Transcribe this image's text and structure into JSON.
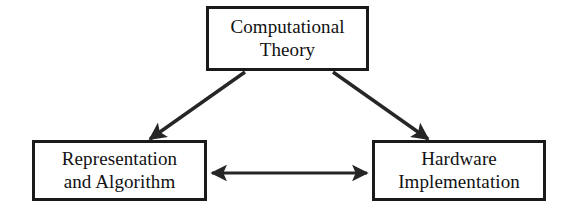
{
  "diagram": {
    "background_color": "#ffffff",
    "box_border_color": "#1a1a1a",
    "arrow_color": "#262626",
    "text_color": "#111111",
    "nodes": [
      {
        "id": "computational-theory",
        "label": "Computational\nTheory",
        "line1": "Computational",
        "line2": "Theory",
        "x": 206,
        "y": 6,
        "width": 163,
        "height": 65
      },
      {
        "id": "representation-and-algorithm",
        "label": "Representation\nand Algorithm",
        "line1": "Representation",
        "line2": "and Algorithm",
        "x": 32,
        "y": 140,
        "width": 175,
        "height": 61
      },
      {
        "id": "hardware-implementation",
        "label": "Hardware\nImplementation",
        "line1": "Hardware",
        "line2": "Implementation",
        "x": 372,
        "y": 140,
        "width": 174,
        "height": 61
      }
    ],
    "edges": [
      {
        "id": "theory-to-representation",
        "from": "computational-theory",
        "to": "representation-and-algorithm",
        "style": "single-arrow",
        "x1": 245,
        "y1": 72,
        "x2": 150,
        "y2": 139
      },
      {
        "id": "theory-to-hardware",
        "from": "computational-theory",
        "to": "hardware-implementation",
        "style": "single-arrow",
        "x1": 333,
        "y1": 72,
        "x2": 428,
        "y2": 139
      },
      {
        "id": "representation-to-hardware",
        "from": "representation-and-algorithm",
        "to": "hardware-implementation",
        "style": "double-arrow",
        "x1": 208,
        "y1": 173,
        "x2": 370,
        "y2": 173
      }
    ]
  }
}
